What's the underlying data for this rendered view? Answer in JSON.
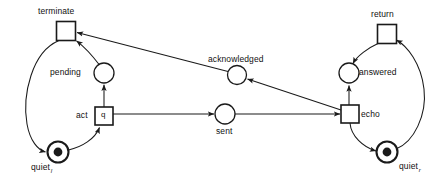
{
  "diagram": {
    "type": "petri-net",
    "width": 444,
    "height": 178,
    "stroke_color": "#1a1a1a",
    "fill_color": "#ffffff",
    "background": "#ffffff",
    "transitions": [
      {
        "id": "terminate",
        "label": "terminate",
        "inner_text": "",
        "x": 66,
        "y": 31,
        "size": 19,
        "label_pos": "above"
      },
      {
        "id": "act",
        "label": "act",
        "inner_text": "q",
        "x": 104,
        "y": 116,
        "size": 18,
        "label_pos": "left"
      },
      {
        "id": "echo",
        "label": "echo",
        "inner_text": "",
        "x": 350,
        "y": 114,
        "size": 18,
        "label_pos": "right"
      },
      {
        "id": "return",
        "label": "return",
        "inner_text": "",
        "x": 387,
        "y": 34,
        "size": 19,
        "label_pos": "above"
      }
    ],
    "places": [
      {
        "id": "pending",
        "label": "pending",
        "x": 104,
        "y": 73,
        "r": 10,
        "marked": false,
        "label_pos": "left"
      },
      {
        "id": "acknowledged",
        "label": "acknowledged",
        "x": 237,
        "y": 75,
        "r": 9.5,
        "marked": false,
        "label_pos": "above"
      },
      {
        "id": "sent",
        "label": "sent",
        "x": 225,
        "y": 114,
        "r": 10,
        "marked": false,
        "label_pos": "below"
      },
      {
        "id": "answered",
        "label": "answered",
        "x": 349,
        "y": 73,
        "r": 10,
        "marked": false,
        "label_pos": "right"
      },
      {
        "id": "quiet_l",
        "label": "quiet",
        "subscript": "l",
        "x": 58,
        "y": 152,
        "r": 10,
        "marked": true,
        "label_pos": "below-left"
      },
      {
        "id": "quiet_r",
        "label": "quiet",
        "subscript": "r",
        "x": 387,
        "y": 152,
        "r": 10,
        "marked": true,
        "label_pos": "below-right"
      }
    ],
    "arcs": [
      {
        "from": "terminate",
        "to": "quiet_l",
        "shape": "curve-left"
      },
      {
        "from": "quiet_l",
        "to": "act",
        "shape": "curve"
      },
      {
        "from": "act",
        "to": "pending",
        "shape": "straight"
      },
      {
        "from": "pending",
        "to": "terminate",
        "shape": "curve"
      },
      {
        "from": "act",
        "to": "sent",
        "shape": "straight"
      },
      {
        "from": "sent",
        "to": "echo",
        "shape": "straight"
      },
      {
        "from": "echo",
        "to": "acknowledged",
        "shape": "straight-diagonal"
      },
      {
        "from": "acknowledged",
        "to": "terminate",
        "shape": "straight-diagonal"
      },
      {
        "from": "echo",
        "to": "quiet_r",
        "shape": "curve"
      },
      {
        "from": "quiet_r",
        "to": "return",
        "shape": "curve-right"
      },
      {
        "from": "return",
        "to": "answered",
        "shape": "curve"
      },
      {
        "from": "answered",
        "to": "echo",
        "shape": "straight"
      }
    ]
  },
  "labels": {
    "terminate": "terminate",
    "pending": "pending",
    "act": "act",
    "act_token": "q",
    "quiet_l": "quiet",
    "quiet_l_sub": "l",
    "acknowledged": "acknowledged",
    "sent": "sent",
    "echo": "echo",
    "answered": "answered",
    "return": "return",
    "quiet_r": "quiet",
    "quiet_r_sub": "r"
  }
}
